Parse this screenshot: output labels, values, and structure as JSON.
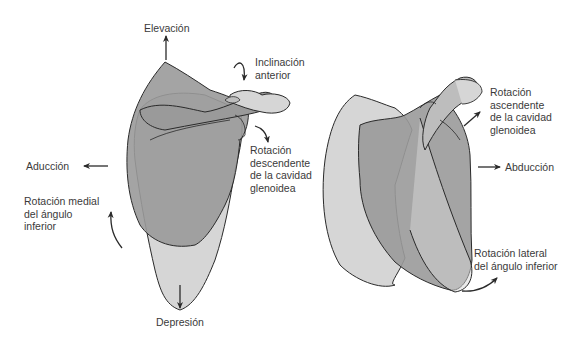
{
  "figure": {
    "left_panel": {
      "labels": {
        "elevation": "Elevación",
        "anterior_tilt": "Inclinación\nanterior",
        "downward_rotation": "Rotación\ndescendente\nde la cavidad\nglenoidea",
        "adduction": "Aducción",
        "medial_rotation": "Rotación medial\ndel ángulo\ninferior",
        "depression": "Depresión"
      }
    },
    "right_panel": {
      "labels": {
        "upward_rotation": "Rotación\nascendente\nde la cavidad\nglenoidea",
        "abduction": "Abducción",
        "lateral_rotation": "Rotación lateral\ndel ángulo inferior"
      }
    },
    "colors": {
      "bone_dark": "#9a9a9a",
      "bone_light": "#d6d6d6",
      "outline": "#2a2a2a",
      "text": "#3a3a3a"
    }
  }
}
